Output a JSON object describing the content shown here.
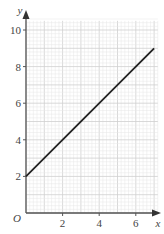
{
  "chart_data": {
    "type": "line",
    "title": "",
    "xlabel": "x",
    "ylabel": "y",
    "origin_label": "O",
    "xlim": [
      0,
      7.2
    ],
    "ylim": [
      0,
      10.5
    ],
    "x_ticks": [
      2,
      4,
      6
    ],
    "y_ticks": [
      2,
      4,
      6,
      8,
      10
    ],
    "grid": true,
    "minor_grid_step": 0.2,
    "major_grid_step": 1,
    "series": [
      {
        "name": "y = x + 2",
        "x": [
          0,
          7
        ],
        "y": [
          2,
          9
        ]
      }
    ],
    "colors": {
      "line": "#222222",
      "axis": "#555555",
      "minor_grid": "#e6e6e6",
      "major_grid": "#cfcfcf"
    }
  }
}
